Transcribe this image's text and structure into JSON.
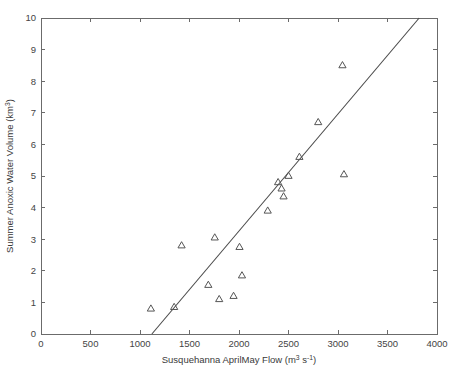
{
  "chart_data": {
    "type": "scatter",
    "title": "",
    "xlabel": "Susquehanna AprilMay Flow (m 3 s-1)",
    "xlabel_parts": {
      "pre": "Susquehanna AprilMay Flow (m",
      "sup1": "3",
      "mid": " s",
      "sup2": "-1",
      "post": ")"
    },
    "ylabel": "Summer Anoxic Water Volume (km3)",
    "ylabel_parts": {
      "pre": "Summer Anoxic Water Volume (km",
      "sup": "3",
      "post": ")"
    },
    "xlim": [
      0,
      4000
    ],
    "ylim": [
      0,
      10
    ],
    "xticks": [
      0,
      500,
      1000,
      1500,
      2000,
      2500,
      3000,
      3500,
      4000
    ],
    "xtick_labels": [
      "0",
      "500",
      "1000",
      "1500",
      "2000",
      "2500",
      "3000",
      "3500",
      "4000"
    ],
    "yticks": [
      0,
      1,
      2,
      3,
      4,
      5,
      6,
      7,
      8,
      9,
      10
    ],
    "ytick_labels": [
      "0",
      "1",
      "2",
      "3",
      "4",
      "5",
      "6",
      "7",
      "8",
      "9",
      "10"
    ],
    "grid": false,
    "legend": null,
    "marker_style": "open-triangle",
    "marker_color": "#555555",
    "line_color": "#4a4a4a",
    "axis_color": "#6b6b6b",
    "points": [
      {
        "x": 1110,
        "y": 0.8
      },
      {
        "x": 1345,
        "y": 0.85
      },
      {
        "x": 1420,
        "y": 2.8
      },
      {
        "x": 1690,
        "y": 1.55
      },
      {
        "x": 1755,
        "y": 3.05
      },
      {
        "x": 1800,
        "y": 1.1
      },
      {
        "x": 1945,
        "y": 1.2
      },
      {
        "x": 2005,
        "y": 2.75
      },
      {
        "x": 2030,
        "y": 1.85
      },
      {
        "x": 2290,
        "y": 3.9
      },
      {
        "x": 2395,
        "y": 4.8
      },
      {
        "x": 2430,
        "y": 4.6
      },
      {
        "x": 2450,
        "y": 4.35
      },
      {
        "x": 2500,
        "y": 5.0
      },
      {
        "x": 2610,
        "y": 5.6
      },
      {
        "x": 2800,
        "y": 6.7
      },
      {
        "x": 3045,
        "y": 8.5
      },
      {
        "x": 3060,
        "y": 5.05
      }
    ],
    "fit_line": {
      "x_start": 1120,
      "y_start": 0,
      "x_end": 3820,
      "y_end": 10,
      "slope": 0.0037,
      "intercept": -4.146
    }
  }
}
